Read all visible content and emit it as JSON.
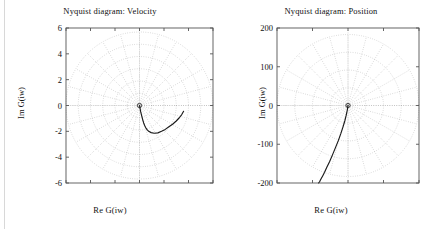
{
  "figure": {
    "background": "#ffffff",
    "axis_color": "#555555",
    "grid_color": "#9a9a9a",
    "curve_color": "#1a1a1a"
  },
  "panels": [
    {
      "id": "velocity",
      "title": "Nyquist diagram: Velocity",
      "xlabel": "Re G(iw)",
      "ylabel": "Im G(iw)"
    },
    {
      "id": "position",
      "title": "Nyquist diagram: Position",
      "xlabel": "Re G(iw)",
      "ylabel": "Im G(iw)"
    }
  ],
  "chart_data": [
    {
      "type": "line",
      "title": "Nyquist diagram: Velocity",
      "xlabel": "Re G(iw)",
      "ylabel": "Im G(iw)",
      "grid": "polar",
      "grid_circles": 6,
      "grid_spokes": 24,
      "xlim": [
        -6,
        6
      ],
      "ylim": [
        -6,
        6
      ],
      "yticks": [
        6,
        4,
        2,
        0,
        -2,
        -4,
        -6
      ],
      "ytick_labels": [
        "6",
        "4",
        "2",
        "0",
        "-2",
        "-4",
        "-6"
      ],
      "xticks": [
        -6,
        -4,
        -2,
        0,
        2,
        4,
        6
      ],
      "xtick_labels": [],
      "series": [
        {
          "name": "G(iw) velocity",
          "x": [
            0.0,
            0.05,
            0.1,
            0.18,
            0.26,
            0.34,
            0.42,
            0.5,
            0.6,
            0.75,
            0.95,
            1.2,
            1.5,
            1.8,
            2.1,
            2.4,
            2.7,
            3.0,
            3.25,
            3.45,
            3.6
          ],
          "y": [
            0.0,
            -0.25,
            -0.5,
            -0.8,
            -1.1,
            -1.35,
            -1.55,
            -1.7,
            -1.85,
            -2.0,
            -2.1,
            -2.15,
            -2.12,
            -2.0,
            -1.85,
            -1.65,
            -1.45,
            -1.2,
            -0.95,
            -0.7,
            -0.45
          ]
        }
      ]
    },
    {
      "type": "line",
      "title": "Nyquist diagram: Position",
      "xlabel": "Re G(iw)",
      "ylabel": "Im G(iw)",
      "grid": "polar",
      "grid_circles": 4,
      "grid_spokes": 24,
      "xlim": [
        -200,
        200
      ],
      "ylim": [
        -200,
        200
      ],
      "yticks": [
        200,
        100,
        0,
        -100,
        -200
      ],
      "ytick_labels": [
        "200",
        "100",
        "0",
        "-100",
        "-200"
      ],
      "xticks": [
        -200,
        -100,
        0,
        100,
        200
      ],
      "xtick_labels": [],
      "series": [
        {
          "name": "G(iw) position",
          "x": [
            0,
            -2,
            -5,
            -9,
            -14,
            -20,
            -27,
            -35,
            -44,
            -52,
            -60,
            -66,
            -71,
            -75,
            -78,
            -80,
            -82,
            -83
          ],
          "y": [
            0,
            -12,
            -25,
            -40,
            -55,
            -72,
            -90,
            -108,
            -128,
            -145,
            -160,
            -172,
            -181,
            -188,
            -193,
            -197,
            -199,
            -200
          ]
        }
      ]
    }
  ]
}
